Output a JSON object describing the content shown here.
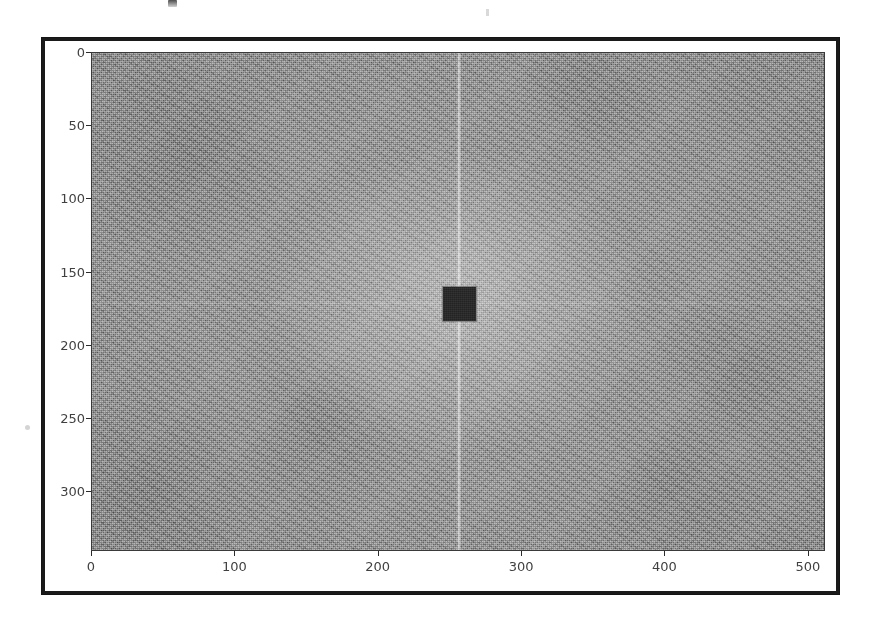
{
  "figure": {
    "kind": "image-plot",
    "frame_color": "#1a1a1a",
    "page_background": "#ffffff"
  },
  "chart_data": {
    "type": "heatmap",
    "title": "",
    "xlabel": "",
    "ylabel": "",
    "xlim": [
      0,
      512
    ],
    "ylim": [
      341,
      0
    ],
    "y_axis_inverted": true,
    "grid": false,
    "legend": null,
    "colormap": "gray",
    "x_ticks": [
      0,
      100,
      200,
      300,
      400,
      500
    ],
    "x_tick_labels": [
      "0",
      "100",
      "200",
      "300",
      "400",
      "500"
    ],
    "y_ticks": [
      0,
      50,
      100,
      150,
      200,
      250,
      300
    ],
    "y_tick_labels": [
      "0",
      "50",
      "100",
      "150",
      "200",
      "250",
      "300"
    ],
    "features": [
      {
        "name": "dark-center-square",
        "kind": "rectangle",
        "fill": "#2b2b2b",
        "x_range": [
          245,
          268
        ],
        "y_range": [
          160,
          183
        ],
        "note": "low-frequency block masked to near-zero magnitude"
      },
      {
        "name": "dc-vertical-streak",
        "kind": "vertical-line",
        "x": 256,
        "brightness": "high",
        "note": "bright column through DC spanning full image height"
      },
      {
        "name": "dc-horizontal-streak",
        "kind": "horizontal-line",
        "y": 171,
        "brightness": "low",
        "note": "faint row through DC"
      },
      {
        "name": "center-halo",
        "kind": "radial-glow",
        "center": [
          256,
          171
        ],
        "note": "broad brighter region of low-frequency energy"
      },
      {
        "name": "speckle-noise",
        "kind": "texture",
        "note": "uniform high-frequency speckle across the whole spectrum"
      }
    ],
    "background_mean_gray": "#8f8f8f"
  },
  "scan_artifacts": {
    "top_text_fragment": "",
    "top_mid_mark": "",
    "left_speck": ""
  }
}
